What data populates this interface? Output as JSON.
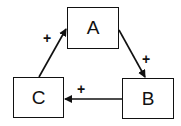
{
  "diagram": {
    "type": "causal-loop",
    "nodes": [
      {
        "id": "A",
        "label": "A"
      },
      {
        "id": "B",
        "label": "B"
      },
      {
        "id": "C",
        "label": "C"
      }
    ],
    "edges": [
      {
        "from": "A",
        "to": "B",
        "sign": "+"
      },
      {
        "from": "B",
        "to": "C",
        "sign": "+"
      },
      {
        "from": "C",
        "to": "A",
        "sign": "+"
      }
    ],
    "colors": {
      "stroke": "#111111",
      "background": "#ffffff"
    }
  }
}
